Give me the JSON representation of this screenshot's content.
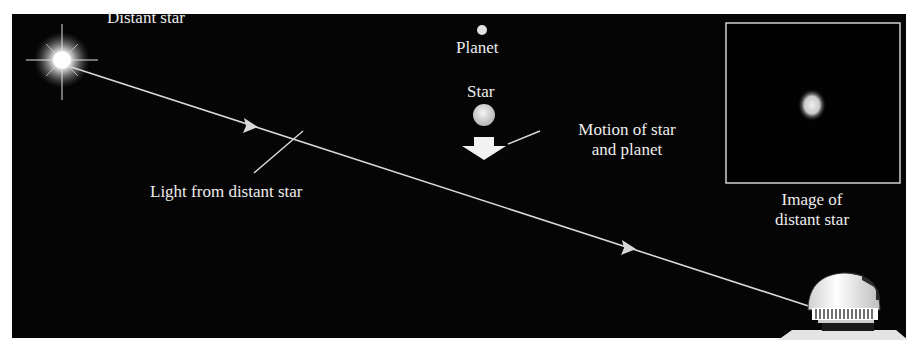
{
  "labels": {
    "distant_star": "Distant star",
    "planet": "Planet",
    "star": "Star",
    "motion_line1": "Motion of star",
    "motion_line2": "and planet",
    "light": "Light from distant star",
    "image_line1": "Image of",
    "image_line2": "distant star"
  },
  "colors": {
    "background": "#050505",
    "line": "#d8d8d8",
    "text": "#ededed"
  }
}
